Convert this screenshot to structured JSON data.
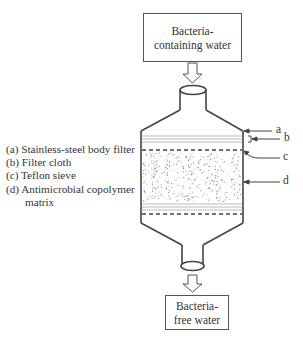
{
  "diagram": {
    "input_box": {
      "line1": "Bacteria-",
      "line2": "containing water"
    },
    "output_box": {
      "line1": "Bacteria-",
      "line2": "free water"
    },
    "callouts": {
      "a": "a",
      "b": "b",
      "c": "c",
      "d": "d"
    },
    "legend": [
      {
        "key": "(a)",
        "text": "Stainless-steel body filter"
      },
      {
        "key": "(b)",
        "text": "Filter cloth"
      },
      {
        "key": "(c)",
        "text": "Teflon sieve"
      },
      {
        "key": "(d)",
        "text": "Antimicrobial copolymer",
        "continuation": "matrix"
      }
    ],
    "colors": {
      "stroke": "#444444",
      "text": "#333333",
      "layer_line": "#999999",
      "dots": "#888888"
    }
  }
}
